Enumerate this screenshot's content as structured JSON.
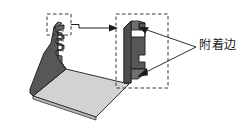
{
  "figure": {
    "title": "",
    "background_color": "#ffffff",
    "annotation_label": "附着边",
    "colors": {
      "dark_face": "#575757",
      "mid_face": "#6a6a6a",
      "light_face": "#d2d2d2",
      "outline": "#1a1a1a",
      "dashed_box": "#3a3a3a",
      "leader_line": "#1a1a1a",
      "text": "#1a1a1a"
    },
    "elements": {
      "iso_part_name": "isometric-flashing-part",
      "profile_part_name": "cross-section-profile",
      "detail_box_left_name": "detail-box-left",
      "detail_box_right_name": "detail-box-right",
      "transfer_arrow_name": "detail-transfer-arrow",
      "leader_upper_name": "leader-line-upper",
      "leader_lower_name": "leader-line-lower"
    }
  }
}
